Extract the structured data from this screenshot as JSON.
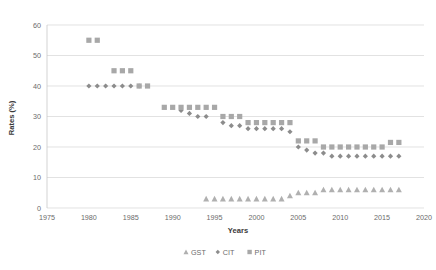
{
  "chart_data": {
    "type": "scatter",
    "title": "",
    "xlabel": "Years",
    "ylabel": "Rates (%)",
    "xlim": [
      1975,
      2020
    ],
    "ylim": [
      0,
      60
    ],
    "xticks": [
      1975,
      1980,
      1985,
      1990,
      1995,
      2000,
      2005,
      2010,
      2015,
      2020
    ],
    "yticks": [
      0,
      10,
      20,
      30,
      40,
      50,
      60
    ],
    "grid": true,
    "legend_position": "bottom",
    "series": [
      {
        "name": "GST",
        "marker": "triangle",
        "color": "#b0b0b0",
        "points": [
          [
            1994,
            3
          ],
          [
            1995,
            3
          ],
          [
            1996,
            3
          ],
          [
            1997,
            3
          ],
          [
            1998,
            3
          ],
          [
            1999,
            3
          ],
          [
            2000,
            3
          ],
          [
            2001,
            3
          ],
          [
            2002,
            3
          ],
          [
            2003,
            3
          ],
          [
            2004,
            4
          ],
          [
            2005,
            5
          ],
          [
            2006,
            5
          ],
          [
            2007,
            5
          ],
          [
            2008,
            6
          ],
          [
            2009,
            6
          ],
          [
            2010,
            6
          ],
          [
            2011,
            6
          ],
          [
            2012,
            6
          ],
          [
            2013,
            6
          ],
          [
            2014,
            6
          ],
          [
            2015,
            6
          ],
          [
            2016,
            6
          ],
          [
            2017,
            6
          ]
        ]
      },
      {
        "name": "CIT",
        "marker": "diamond",
        "color": "#8c8c8c",
        "points": [
          [
            1980,
            40
          ],
          [
            1981,
            40
          ],
          [
            1982,
            40
          ],
          [
            1983,
            40
          ],
          [
            1984,
            40
          ],
          [
            1985,
            40
          ],
          [
            1986,
            40
          ],
          [
            1991,
            32
          ],
          [
            1992,
            31
          ],
          [
            1993,
            30
          ],
          [
            1994,
            30
          ],
          [
            1996,
            28
          ],
          [
            1997,
            27
          ],
          [
            1998,
            27
          ],
          [
            1999,
            26
          ],
          [
            2000,
            26
          ],
          [
            2001,
            26
          ],
          [
            2002,
            26
          ],
          [
            2003,
            26
          ],
          [
            2004,
            25
          ],
          [
            2005,
            20
          ],
          [
            2006,
            19
          ],
          [
            2007,
            18
          ],
          [
            2008,
            18
          ],
          [
            2009,
            17
          ],
          [
            2010,
            17
          ],
          [
            2011,
            17
          ],
          [
            2012,
            17
          ],
          [
            2013,
            17
          ],
          [
            2014,
            17
          ],
          [
            2015,
            17
          ],
          [
            2016,
            17
          ],
          [
            2017,
            17
          ]
        ]
      },
      {
        "name": "PIT",
        "marker": "square",
        "color": "#a8a8a8",
        "points": [
          [
            1980,
            55
          ],
          [
            1981,
            55
          ],
          [
            1983,
            45
          ],
          [
            1984,
            45
          ],
          [
            1985,
            45
          ],
          [
            1986,
            40
          ],
          [
            1987,
            40
          ],
          [
            1989,
            33
          ],
          [
            1990,
            33
          ],
          [
            1991,
            33
          ],
          [
            1992,
            33
          ],
          [
            1993,
            33
          ],
          [
            1994,
            33
          ],
          [
            1995,
            33
          ],
          [
            1996,
            30
          ],
          [
            1997,
            30
          ],
          [
            1998,
            30
          ],
          [
            1999,
            28
          ],
          [
            2000,
            28
          ],
          [
            2001,
            28
          ],
          [
            2002,
            28
          ],
          [
            2003,
            28
          ],
          [
            2004,
            28
          ],
          [
            2005,
            22
          ],
          [
            2006,
            22
          ],
          [
            2007,
            22
          ],
          [
            2008,
            20
          ],
          [
            2009,
            20
          ],
          [
            2010,
            20
          ],
          [
            2011,
            20
          ],
          [
            2012,
            20
          ],
          [
            2013,
            20
          ],
          [
            2014,
            20
          ],
          [
            2015,
            20
          ],
          [
            2016,
            21.5
          ],
          [
            2017,
            21.5
          ]
        ]
      }
    ]
  },
  "legend": {
    "items": [
      {
        "label": "GST",
        "marker": "triangle-icon"
      },
      {
        "label": "CIT",
        "marker": "diamond-icon"
      },
      {
        "label": "PIT",
        "marker": "square-icon"
      }
    ]
  },
  "axes": {
    "x_title": "Years",
    "y_title": "Rates (%)"
  }
}
